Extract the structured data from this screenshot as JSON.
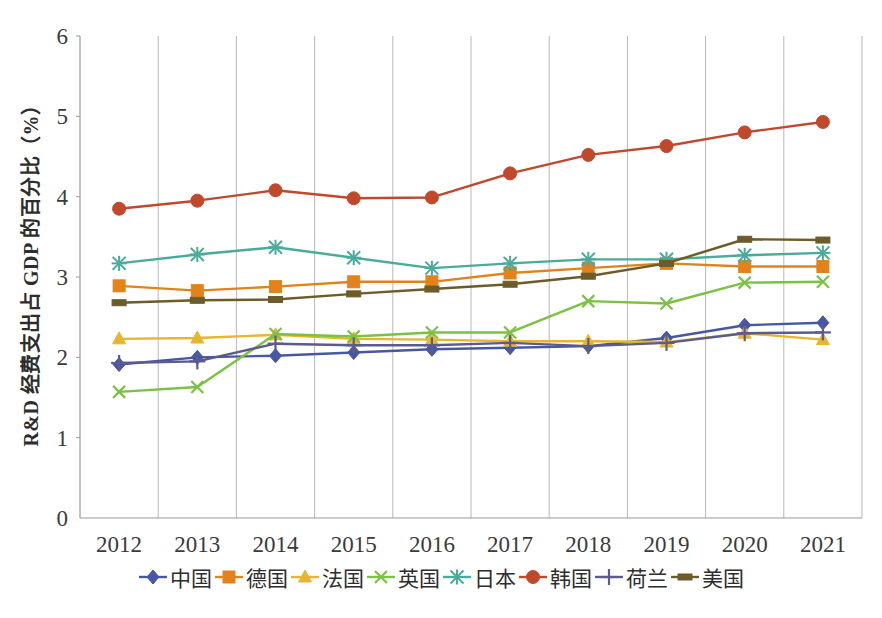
{
  "chart_data": {
    "type": "line",
    "title": "",
    "xlabel": "",
    "ylabel": "R&D 经费支出占 GDP 的百分比（%）",
    "categories": [
      "2012",
      "2013",
      "2014",
      "2015",
      "2016",
      "2017",
      "2018",
      "2019",
      "2020",
      "2021"
    ],
    "x": [
      2012,
      2013,
      2014,
      2015,
      2016,
      2017,
      2018,
      2019,
      2020,
      2021
    ],
    "ylim": [
      0,
      6
    ],
    "yticks": [
      "0",
      "1",
      "2",
      "3",
      "4",
      "5",
      "6"
    ],
    "grid": "vertical",
    "legend_position": "bottom",
    "series": [
      {
        "name": "中国",
        "color": "#4857a4",
        "marker": "diamond",
        "values": [
          1.91,
          2.0,
          2.02,
          2.06,
          2.1,
          2.12,
          2.14,
          2.24,
          2.4,
          2.43
        ]
      },
      {
        "name": "德国",
        "color": "#e3821a",
        "marker": "square",
        "values": [
          2.89,
          2.83,
          2.88,
          2.94,
          2.94,
          3.05,
          3.11,
          3.17,
          3.13,
          3.13
        ]
      },
      {
        "name": "法国",
        "color": "#e8b62c",
        "marker": "triangle",
        "values": [
          2.23,
          2.24,
          2.28,
          2.23,
          2.22,
          2.2,
          2.2,
          2.19,
          2.3,
          2.22
        ]
      },
      {
        "name": "英国",
        "color": "#7cc142",
        "marker": "x",
        "values": [
          1.57,
          1.63,
          2.29,
          2.26,
          2.31,
          2.31,
          2.7,
          2.67,
          2.93,
          2.94
        ]
      },
      {
        "name": "日本",
        "color": "#4aab9a",
        "marker": "asterisk",
        "values": [
          3.17,
          3.28,
          3.37,
          3.24,
          3.11,
          3.17,
          3.22,
          3.22,
          3.27,
          3.3
        ]
      },
      {
        "name": "韩国",
        "color": "#c0492c",
        "marker": "circle",
        "values": [
          3.85,
          3.95,
          4.08,
          3.98,
          3.99,
          4.29,
          4.52,
          4.63,
          4.8,
          4.93
        ]
      },
      {
        "name": "荷兰",
        "color": "#5b5b8f",
        "marker": "plus",
        "values": [
          1.93,
          1.95,
          2.17,
          2.15,
          2.15,
          2.18,
          2.14,
          2.18,
          2.3,
          2.31
        ]
      },
      {
        "name": "美国",
        "color": "#6b5c2a",
        "marker": "dash",
        "values": [
          2.68,
          2.71,
          2.72,
          2.79,
          2.85,
          2.91,
          3.01,
          3.17,
          3.47,
          3.46
        ]
      }
    ]
  },
  "legend": {
    "items": [
      {
        "label": "中国",
        "color": "#4857a4",
        "marker": "diamond"
      },
      {
        "label": "德国",
        "color": "#e3821a",
        "marker": "square"
      },
      {
        "label": "法国",
        "color": "#e8b62c",
        "marker": "triangle"
      },
      {
        "label": "英国",
        "color": "#7cc142",
        "marker": "x"
      },
      {
        "label": "日本",
        "color": "#4aab9a",
        "marker": "asterisk"
      },
      {
        "label": "韩国",
        "color": "#c0492c",
        "marker": "circle"
      },
      {
        "label": "荷兰",
        "color": "#5b5b8f",
        "marker": "plus"
      },
      {
        "label": "美国",
        "color": "#6b5c2a",
        "marker": "dash"
      }
    ]
  },
  "axes": {
    "y_title": "R&D 经费支出占 GDP 的百分比（%）",
    "y_ticks": [
      "6",
      "5",
      "4",
      "3",
      "2",
      "1",
      "0"
    ],
    "x_ticks": [
      "2012",
      "2013",
      "2014",
      "2015",
      "2016",
      "2017",
      "2018",
      "2019",
      "2020",
      "2021"
    ]
  },
  "colors": {
    "axis": "#9a9a9a",
    "grid": "#b8b8b8",
    "text": "#3b3b3b"
  }
}
